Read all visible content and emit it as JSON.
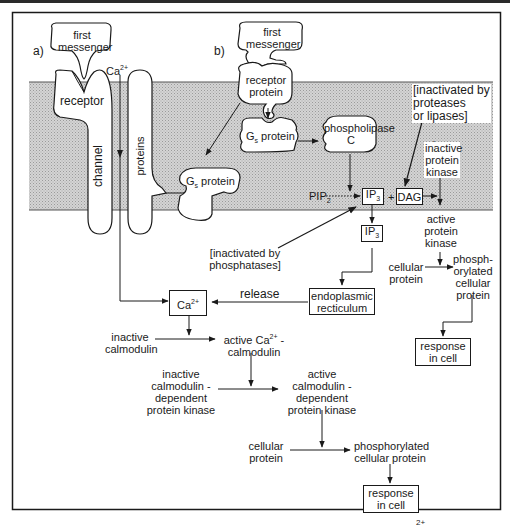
{
  "diagram": {
    "type": "signal-transduction-pathways",
    "panels": {
      "a": {
        "tag": "a)",
        "first_messenger": [
          "first",
          "messenger"
        ],
        "receptor": "receptor",
        "channel": "channel",
        "proteins": "proteins",
        "ion": "Ca",
        "ion_charge": "2+"
      },
      "b": {
        "tag": "b)",
        "first_messenger": [
          "first",
          "messenger"
        ],
        "receptor_protein": [
          "receptor",
          "protein"
        ],
        "gs_protein_1": {
          "main": "G",
          "sub": "s",
          "rest": " protein"
        },
        "gs_protein_2": {
          "main": "G",
          "sub": "s",
          "rest": " protein"
        },
        "phospholipase": [
          "phospholipase",
          "C"
        ],
        "pip2": {
          "main": "PIP",
          "sub": "2"
        },
        "ip3_membrane": {
          "main": "IP",
          "sub": "3"
        },
        "plus": "+",
        "dag": "DAG",
        "ip3_cytosol": {
          "main": "IP",
          "sub": "3"
        },
        "inactivated_phosphatases": [
          "[inactivated  by",
          "phosphatases]"
        ]
      },
      "c": {
        "tag": "c)",
        "inactivated_proteases": [
          "[inactivated  by",
          "proteases",
          "or  lipases]"
        ],
        "inactive_protein_kinase": [
          "inactive",
          "protein",
          "kinase"
        ],
        "active_protein_kinase": [
          "active",
          "protein",
          "kinase"
        ],
        "cellular_protein": [
          "cellular",
          "protein"
        ],
        "phosphorylated_cellular_protein": [
          "phosph-",
          "orylated",
          "cellular",
          "protein"
        ],
        "response_in_cell": [
          "response",
          "in  cell"
        ]
      }
    },
    "calcium_pathway": {
      "ca_box": {
        "main": "Ca",
        "sup": "2+"
      },
      "release": "release",
      "endoplasmic_reticulum": [
        "endoplasmic",
        "recticulum"
      ],
      "inactive_calmodulin": [
        "inactive",
        "calmodulin"
      ],
      "active_ca_calmodulin": {
        "line1_main": "active  Ca",
        "line1_sup": "2+",
        "line1_end": " -",
        "line2": "calmodulin"
      },
      "inactive_cam_kinase": [
        "inactive",
        "calmodulin  -",
        "dependent",
        "protein  kinase"
      ],
      "active_cam_kinase": [
        "active",
        "calmodulin  -",
        "dependent",
        "protein  kinase"
      ],
      "cellular_protein": [
        "cellular",
        "protein"
      ],
      "phosphorylated_cellular_protein": [
        "phosphorylated",
        "cellular  protein"
      ],
      "response_in_cell": [
        "response",
        "in  cell"
      ]
    },
    "footer_fragment": {
      "sup": "2+"
    }
  }
}
